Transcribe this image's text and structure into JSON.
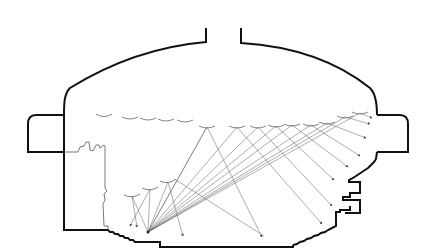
{
  "diagram": {
    "type": "acoustic-ray-section",
    "colors": {
      "walls": "#111111",
      "rays": "#6a6a6a",
      "panels": "#777777",
      "background": "#ffffff"
    },
    "source": {
      "x": 148,
      "y": 232
    },
    "ceiling_panels": [
      {
        "x": 104,
        "y": 115
      },
      {
        "x": 130,
        "y": 118
      },
      {
        "x": 148,
        "y": 119
      },
      {
        "x": 166,
        "y": 120
      },
      {
        "x": 185,
        "y": 120
      },
      {
        "x": 207,
        "y": 127
      },
      {
        "x": 237,
        "y": 127
      },
      {
        "x": 258,
        "y": 127
      },
      {
        "x": 276,
        "y": 126
      },
      {
        "x": 292,
        "y": 125
      },
      {
        "x": 311,
        "y": 125
      },
      {
        "x": 327,
        "y": 123
      },
      {
        "x": 345,
        "y": 117
      },
      {
        "x": 360,
        "y": 113
      }
    ],
    "stage_panels": [
      {
        "x": 132,
        "y": 196
      },
      {
        "x": 150,
        "y": 189
      },
      {
        "x": 168,
        "y": 182
      }
    ],
    "rays": [
      {
        "panel": {
          "x": 207,
          "y": 127
        },
        "target": {
          "x": 262,
          "y": 237
        }
      },
      {
        "panel": {
          "x": 237,
          "y": 127
        },
        "target": {
          "x": 260,
          "y": 236
        }
      },
      {
        "panel": {
          "x": 258,
          "y": 127
        },
        "target": {
          "x": 322,
          "y": 224
        }
      },
      {
        "panel": {
          "x": 276,
          "y": 126
        },
        "target": {
          "x": 332,
          "y": 206
        }
      },
      {
        "panel": {
          "x": 292,
          "y": 125
        },
        "target": {
          "x": 334,
          "y": 180
        }
      },
      {
        "panel": {
          "x": 311,
          "y": 125
        },
        "target": {
          "x": 348,
          "y": 167
        }
      },
      {
        "panel": {
          "x": 327,
          "y": 123
        },
        "target": {
          "x": 360,
          "y": 156
        }
      },
      {
        "panel": {
          "x": 345,
          "y": 117
        },
        "target": {
          "x": 366,
          "y": 138
        }
      },
      {
        "panel": {
          "x": 360,
          "y": 113
        },
        "target": {
          "x": 370,
          "y": 124
        }
      }
    ],
    "stage_rays": [
      {
        "panel": {
          "x": 132,
          "y": 196
        },
        "target": {
          "x": 137,
          "y": 227
        }
      },
      {
        "panel": {
          "x": 150,
          "y": 189
        },
        "target": {
          "x": 130,
          "y": 226
        }
      },
      {
        "panel": {
          "x": 168,
          "y": 182
        },
        "target": {
          "x": 183,
          "y": 236
        }
      }
    ]
  }
}
